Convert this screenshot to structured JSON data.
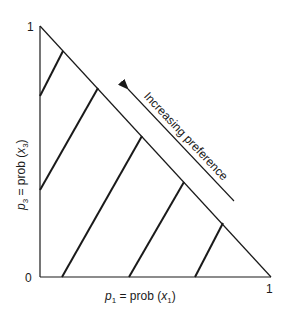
{
  "diagram": {
    "type": "Marschak-Machina probability triangle",
    "axes": {
      "x": {
        "label_var": "p",
        "label_sub": "1",
        "label_rest": " = prob (",
        "label_arg": "x",
        "label_arg_sub": "1",
        "label_close": ")",
        "tick_min": "0",
        "tick_max": "1"
      },
      "y": {
        "label_var": "p",
        "label_sub": "3",
        "label_rest": " = prob (",
        "label_arg": "x",
        "label_arg_sub": "3",
        "label_close": ")",
        "tick_max": "1"
      }
    },
    "arrow_label": "Increasing preference",
    "indifference_curves": [
      {
        "x1": 40,
        "y1": 96,
        "x2": 63,
        "y2": 51
      },
      {
        "x1": 40,
        "y1": 190,
        "x2": 98,
        "y2": 88
      },
      {
        "x1": 62,
        "y1": 277,
        "x2": 142,
        "y2": 136
      },
      {
        "x1": 129,
        "y1": 277,
        "x2": 184,
        "y2": 182
      },
      {
        "x1": 195,
        "y1": 277,
        "x2": 223,
        "y2": 223
      }
    ],
    "colors": {
      "line": "#1a1a1a",
      "background": "#ffffff"
    }
  }
}
